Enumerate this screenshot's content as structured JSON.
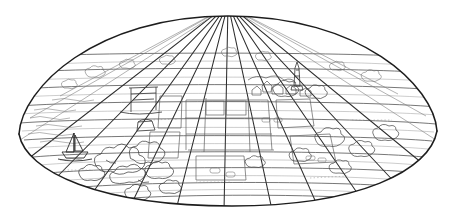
{
  "illustration": {
    "title": "Dome-shaped landscape perspective line drawing",
    "medium": "black line art on white background",
    "background_color": "#ffffff",
    "line_color": "#222222",
    "detail_line_color": "#555555",
    "faint_line_color": "#777777",
    "canvas": {
      "width": 453,
      "height": 216
    }
  },
  "shape": {
    "name": "lens-dome-outline",
    "description": "wide flattened dome / lens outline, apex at top center",
    "apex": {
      "x": 228,
      "y": 16
    },
    "left_point": {
      "x": 19,
      "y": 134
    },
    "right_point": {
      "x": 437,
      "y": 131
    },
    "bottom": {
      "x": 232,
      "y": 206
    },
    "outline_stroke_width": 1.4
  },
  "grid": {
    "meridian_count": 11,
    "parallel_count": 10,
    "vanishing_point": {
      "x": 228,
      "y": 2
    },
    "meridian_label": "radiating meridian lines converging at apex",
    "parallel_label": "horizontal parallel bands across the dome"
  },
  "scene_elements": [
    {
      "name": "sailboat",
      "label": "Sailboat on water",
      "x": 75,
      "y": 152
    },
    {
      "name": "water-area",
      "label": "Water / sea at left",
      "x": 55,
      "y": 130
    },
    {
      "name": "bridge-frame",
      "label": "Bridge or gantry structure",
      "x": 142,
      "y": 97
    },
    {
      "name": "obelisk-monument",
      "label": "Tall obelisk monument",
      "x": 296,
      "y": 72
    },
    {
      "name": "tree-cluster-left",
      "label": "Dense tree cluster lower left",
      "x": 125,
      "y": 165
    },
    {
      "name": "tree-cluster-right",
      "label": "Tree cluster right side",
      "x": 330,
      "y": 140
    },
    {
      "name": "field-plots",
      "label": "Rectangular farm field plots",
      "x": 228,
      "y": 125
    },
    {
      "name": "town-cluster",
      "label": "Small town / building cluster",
      "x": 275,
      "y": 95
    }
  ],
  "colors": {
    "outline": "#222222",
    "grid": "#3a3a3a",
    "detail": "#5a5a5a",
    "faint": "#8a8a8a",
    "paper": "#ffffff"
  }
}
